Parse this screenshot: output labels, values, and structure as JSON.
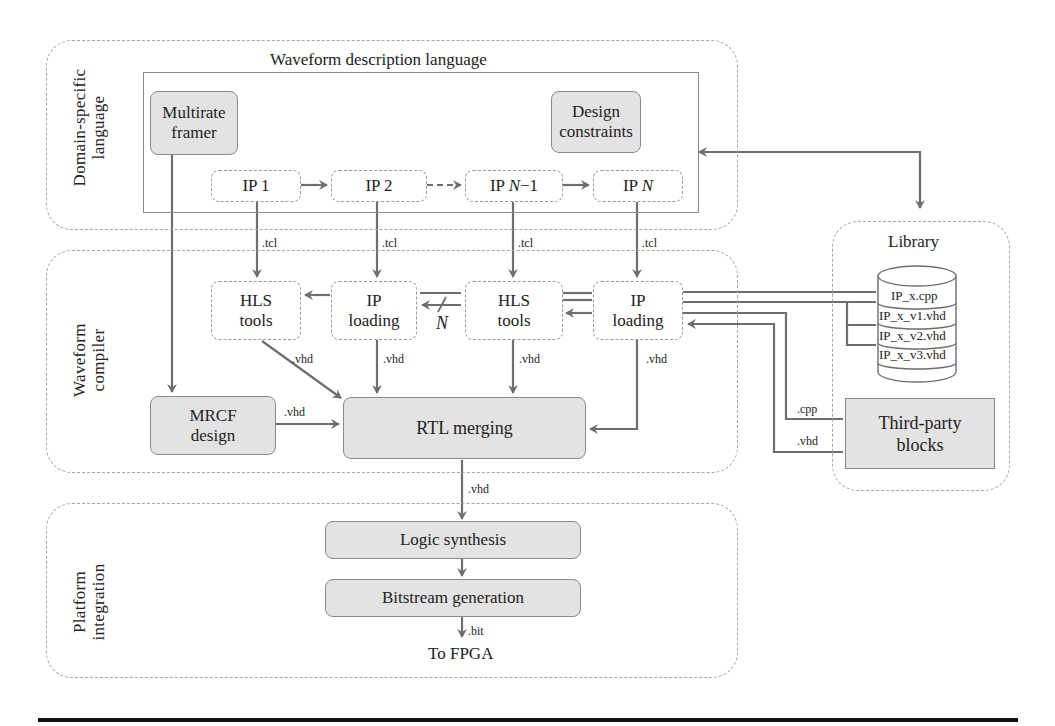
{
  "regions": {
    "dsl": {
      "label_line1": "Domain-specific",
      "label_line2": "language"
    },
    "compiler": {
      "label_line1": "Waveform",
      "label_line2": "compiler"
    },
    "platform": {
      "label_line1": "Platform",
      "label_line2": "integration"
    },
    "library": {
      "title": "Library"
    }
  },
  "wdl": {
    "title": "Waveform description language",
    "multirate_framer": {
      "line1": "Multirate",
      "line2": "framer"
    },
    "design_constraints": {
      "line1": "Design",
      "line2": "constraints"
    },
    "ips": [
      {
        "prefix": "IP 1",
        "italic": ""
      },
      {
        "prefix": "IP 2",
        "italic": ""
      },
      {
        "prefix": "IP ",
        "italic": "N",
        "suffix": "−1"
      },
      {
        "prefix": "IP ",
        "italic": "N",
        "suffix": ""
      }
    ]
  },
  "compiler": {
    "hls1": {
      "line1": "HLS",
      "line2": "tools"
    },
    "iploading1": {
      "line1": "IP",
      "line2": "loading"
    },
    "hls2": {
      "line1": "HLS",
      "line2": "tools"
    },
    "iploading2": {
      "line1": "IP",
      "line2": "loading"
    },
    "n_label": "N",
    "mrcf": {
      "line1": "MRCF",
      "line2": "design"
    },
    "rtl_merging": "RTL merging"
  },
  "platform": {
    "logic_synthesis": "Logic synthesis",
    "bitstream_generation": "Bitstream generation",
    "to_fpga": "To FPGA"
  },
  "library": {
    "db_entries": [
      "IP_x.cpp",
      "IP_x_v1.vhd",
      "IP_x_v2.vhd",
      "IP_x_v3.vhd"
    ],
    "third_party": {
      "line1": "Third-party",
      "line2": "blocks"
    }
  },
  "edge_labels": {
    "tcl": ".tcl",
    "vhd": ".vhd",
    "cpp": ".cpp",
    "bit": ".bit"
  },
  "colors": {
    "box_fill": "#e3e3e3",
    "arrow": "#6e6e6e",
    "dashed_border": "#a5a5a5"
  }
}
